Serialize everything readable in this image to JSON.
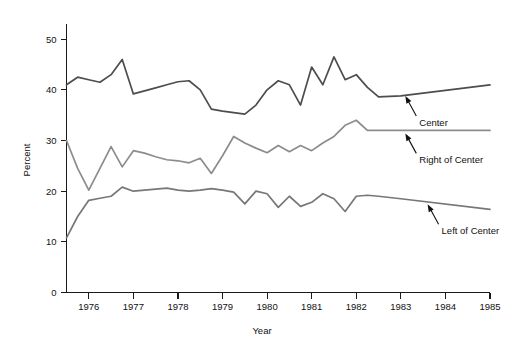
{
  "chart_data": {
    "type": "line",
    "title": "",
    "xlabel": "Year",
    "ylabel": "Percent",
    "xlim": [
      1975.5,
      1985.0
    ],
    "ylim": [
      0,
      53
    ],
    "grid": false,
    "legend_position": "inline-annotations",
    "yticks": [
      0,
      10,
      20,
      30,
      40,
      50
    ],
    "ytick_labels": [
      "0",
      "10",
      "20",
      "30",
      "40",
      "50"
    ],
    "xticks": [
      1976,
      1977,
      1978,
      1979,
      1980,
      1981,
      1982,
      1983,
      1984,
      1985
    ],
    "xtick_labels": [
      "1976",
      "1977",
      "1978",
      "1979",
      "1980",
      "1981",
      "1982",
      "1983",
      "1984",
      "1985"
    ],
    "x": [
      1975.5,
      1975.75,
      1976.0,
      1976.25,
      1976.5,
      1976.75,
      1977.0,
      1977.25,
      1977.5,
      1977.75,
      1978.0,
      1978.25,
      1978.5,
      1978.75,
      1979.0,
      1979.25,
      1979.5,
      1979.75,
      1980.0,
      1980.25,
      1980.5,
      1980.75,
      1981.0,
      1981.25,
      1981.5,
      1981.75,
      1982.0,
      1982.25,
      1982.5,
      1983.0,
      1985.0
    ],
    "series": [
      {
        "name": "Center",
        "color": "#4d4d4d",
        "values": [
          41.0,
          42.5,
          42.0,
          41.5,
          43.0,
          46.0,
          39.2,
          39.8,
          40.4,
          41.0,
          41.6,
          41.8,
          40.0,
          36.2,
          35.8,
          35.5,
          35.2,
          37.0,
          40.0,
          41.8,
          41.0,
          37.0,
          44.5,
          41.0,
          46.5,
          42.0,
          43.0,
          40.5,
          38.6,
          38.8,
          41.0
        ]
      },
      {
        "name": "Right of Center",
        "color": "#8c8c8c",
        "values": [
          30.0,
          24.5,
          20.2,
          24.5,
          28.8,
          24.8,
          28.0,
          27.5,
          26.8,
          26.2,
          26.0,
          25.6,
          26.5,
          23.5,
          27.0,
          30.8,
          29.5,
          28.5,
          27.6,
          29.0,
          27.8,
          29.0,
          28.0,
          29.5,
          30.8,
          33.0,
          34.0,
          32.0,
          32.0,
          32.0,
          32.0
        ]
      },
      {
        "name": "Left of Center",
        "color": "#777777",
        "values": [
          10.8,
          15.0,
          18.2,
          18.6,
          19.0,
          20.8,
          20.0,
          20.2,
          20.4,
          20.6,
          20.2,
          20.0,
          20.2,
          20.5,
          20.2,
          19.8,
          17.5,
          20.0,
          19.5,
          16.8,
          19.0,
          17.0,
          17.8,
          19.5,
          18.5,
          16.0,
          19.0,
          19.2,
          19.0,
          18.5,
          16.4
        ]
      }
    ],
    "annotations": [
      {
        "label": "Center",
        "target_x": 1983.1,
        "target_y": 39.4
      },
      {
        "label": "Right of Center",
        "target_x": 1983.1,
        "target_y": 32.0
      },
      {
        "label": "Left of Center",
        "target_x": 1983.6,
        "target_y": 18.0
      }
    ]
  }
}
